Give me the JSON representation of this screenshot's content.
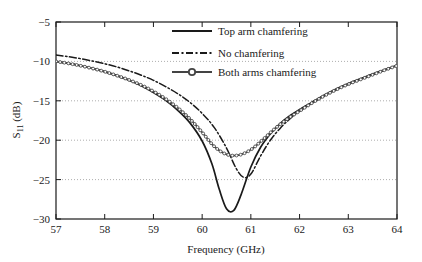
{
  "chart_data": {
    "type": "line",
    "title": "",
    "xlabel": "Frequency (GHz)",
    "ylabel": "S11 (dB)",
    "ylabel_base": "S",
    "ylabel_sub": "11",
    "ylabel_unit": " (dB)",
    "xlim": [
      57,
      64
    ],
    "ylim": [
      -30,
      -5
    ],
    "xticks": [
      "57",
      "58",
      "59",
      "60",
      "61",
      "62",
      "63",
      "64"
    ],
    "yticks": [
      "−5",
      "−10",
      "−15",
      "−20",
      "−25",
      "−30"
    ],
    "xtick_values": [
      57,
      58,
      59,
      60,
      61,
      62,
      63,
      64
    ],
    "ytick_values": [
      -5,
      -10,
      -15,
      -20,
      -25,
      -30
    ],
    "grid": "horizontal-dotted",
    "grid_values": [
      -10,
      -15,
      -20,
      -25
    ],
    "grid_color": "#999999",
    "legend_position": "top-right",
    "series": [
      {
        "name": "Top arm chamfering",
        "style": "solid",
        "marker": "none",
        "color": "#1a1a1a",
        "x": [
          57.0,
          57.25,
          57.5,
          57.75,
          58.0,
          58.25,
          58.5,
          58.75,
          59.0,
          59.25,
          59.5,
          59.75,
          60.0,
          60.2,
          60.35,
          60.5,
          60.65,
          60.8,
          61.0,
          61.2,
          61.4,
          61.6,
          61.8,
          62.0,
          62.25,
          62.5,
          62.75,
          63.0,
          63.25,
          63.5,
          63.75,
          64.0
        ],
        "y": [
          -10.0,
          -10.25,
          -10.55,
          -10.9,
          -11.3,
          -11.8,
          -12.4,
          -13.1,
          -13.95,
          -14.95,
          -16.2,
          -17.8,
          -20.1,
          -23.0,
          -26.2,
          -28.7,
          -28.9,
          -26.9,
          -23.4,
          -20.9,
          -19.2,
          -17.9,
          -16.9,
          -16.1,
          -15.2,
          -14.3,
          -13.5,
          -12.8,
          -12.2,
          -11.6,
          -11.05,
          -10.5
        ]
      },
      {
        "name": "No chamfering",
        "style": "dashdot",
        "marker": "none",
        "color": "#1a1a1a",
        "x": [
          57.0,
          57.25,
          57.5,
          57.75,
          58.0,
          58.25,
          58.5,
          58.75,
          59.0,
          59.25,
          59.5,
          59.75,
          60.0,
          60.25,
          60.5,
          60.7,
          60.85,
          61.0,
          61.2,
          61.4,
          61.6,
          61.8,
          62.0,
          62.25,
          62.5,
          62.75,
          63.0,
          63.25,
          63.5,
          63.75,
          64.0
        ],
        "y": [
          -9.2,
          -9.4,
          -9.65,
          -9.95,
          -10.3,
          -10.7,
          -11.2,
          -11.75,
          -12.4,
          -13.2,
          -14.1,
          -15.2,
          -16.6,
          -18.4,
          -21.0,
          -23.6,
          -24.7,
          -24.3,
          -22.0,
          -20.0,
          -18.5,
          -17.3,
          -16.3,
          -15.3,
          -14.4,
          -13.6,
          -12.9,
          -12.25,
          -11.65,
          -11.1,
          -10.5
        ]
      },
      {
        "name": "Both arms chamfering",
        "style": "solid-circles",
        "marker": "circle",
        "color": "#444444",
        "x": [
          57.0,
          57.25,
          57.5,
          57.75,
          58.0,
          58.25,
          58.5,
          58.75,
          59.0,
          59.25,
          59.5,
          59.75,
          60.0,
          60.25,
          60.5,
          60.75,
          61.0,
          61.25,
          61.5,
          61.75,
          62.0,
          62.25,
          62.5,
          62.75,
          63.0,
          63.25,
          63.5,
          63.75,
          64.0
        ],
        "y": [
          -10.0,
          -10.25,
          -10.55,
          -10.9,
          -11.3,
          -11.8,
          -12.35,
          -13.0,
          -13.8,
          -14.75,
          -15.9,
          -17.3,
          -19.0,
          -20.8,
          -21.8,
          -21.9,
          -21.2,
          -19.9,
          -18.5,
          -17.3,
          -16.3,
          -15.3,
          -14.4,
          -13.6,
          -12.9,
          -12.3,
          -11.7,
          -11.1,
          -10.55
        ]
      }
    ]
  },
  "legend": {
    "items": [
      {
        "label": "Top arm chamfering"
      },
      {
        "label": "No chamfering"
      },
      {
        "label": "Both arms chamfering"
      }
    ]
  }
}
